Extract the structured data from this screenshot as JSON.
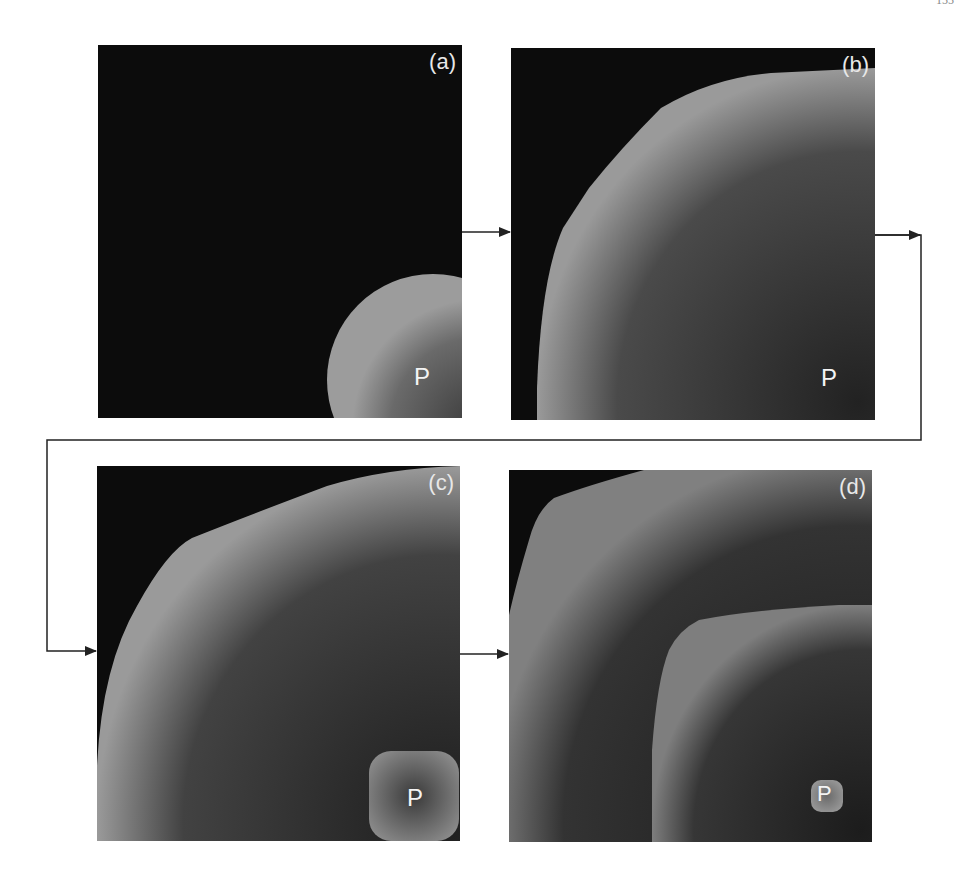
{
  "page": {
    "number": "155"
  },
  "figure": {
    "panels": [
      {
        "id": "a",
        "label": "(a)",
        "marker": "P"
      },
      {
        "id": "b",
        "label": "(b)",
        "marker": "P"
      },
      {
        "id": "c",
        "label": "(c)",
        "marker": "P"
      },
      {
        "id": "d",
        "label": "(d)",
        "marker": "P"
      }
    ],
    "colors": {
      "background": "#0c0c0c",
      "region_edge": "#9a9a9a",
      "region_core": "#2a2a2a",
      "arrow": "#222222"
    },
    "flow": [
      "a",
      "b",
      "c",
      "d"
    ]
  }
}
